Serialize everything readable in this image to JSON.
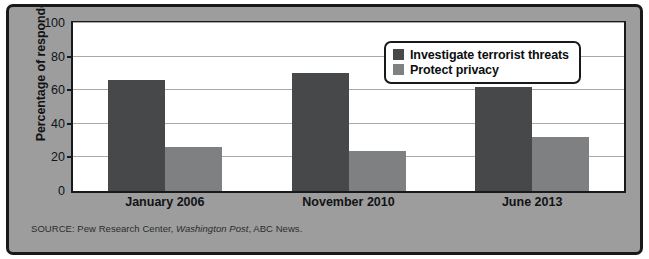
{
  "chart_data": {
    "type": "bar",
    "title": "",
    "xlabel": "",
    "ylabel": "Percentage of respondents",
    "ylim": [
      0,
      100
    ],
    "yticks": [
      0,
      20,
      40,
      60,
      80,
      100
    ],
    "grid": true,
    "legend_position": "top-right",
    "categories": [
      "January 2006",
      "November 2010",
      "June 2013"
    ],
    "series": [
      {
        "name": "Investigate terrorist threats",
        "color": "#474849",
        "values": [
          66,
          70,
          62
        ]
      },
      {
        "name": "Protect privacy",
        "color": "#7f8081",
        "values": [
          26,
          24,
          32
        ]
      }
    ]
  },
  "source": {
    "prefix": "SOURCE: Pew Research Center, ",
    "italic": "Washington Post",
    "suffix": ", ABC News."
  },
  "colors": {
    "frame_border": "#17191a",
    "frame_background": "#9d9d9d",
    "plot_background": "#ffffff",
    "gridline": "#a9a9a9",
    "series_dark": "#474849",
    "series_light": "#7f8081"
  }
}
